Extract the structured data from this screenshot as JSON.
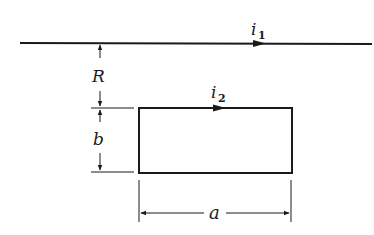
{
  "diagram": {
    "type": "physics-schematic",
    "wire": {
      "current_symbol": "i",
      "current_subscript": "1",
      "direction": "right"
    },
    "loop": {
      "current_symbol": "i",
      "current_subscript": "2",
      "direction": "right along top edge"
    },
    "dimensions": {
      "separation_label": "R",
      "height_label": "b",
      "width_label": "a"
    },
    "colors": {
      "ink": "#1a1a1a",
      "background": "#ffffff"
    }
  }
}
